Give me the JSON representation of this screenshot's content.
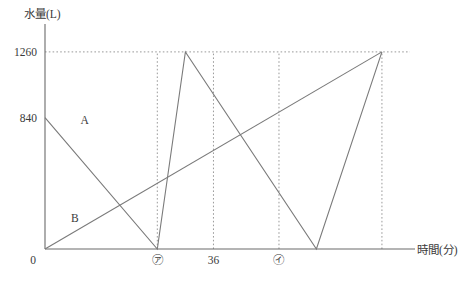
{
  "chart_data": {
    "type": "line",
    "title": "",
    "xlabel": "時間(分)",
    "ylabel": "水量(L)",
    "xlim": [
      0,
      78
    ],
    "ylim": [
      0,
      1400
    ],
    "grid": false,
    "legend_position": "inline",
    "y_ticks": [
      {
        "value": 1260,
        "label": "1260"
      },
      {
        "value": 840,
        "label": "840"
      },
      {
        "value": 0,
        "label": "0"
      }
    ],
    "x_ticks": [
      {
        "value": 0,
        "label": "0"
      },
      {
        "value": 24,
        "label": "㋐"
      },
      {
        "value": 36,
        "label": "36"
      },
      {
        "value": 50,
        "label": "㋑"
      }
    ],
    "guides": [
      {
        "kind": "horizontal",
        "value": 1260,
        "style": "dotted"
      },
      {
        "kind": "vertical",
        "value": 24,
        "style": "dotted"
      },
      {
        "kind": "vertical",
        "value": 36,
        "style": "dotted"
      },
      {
        "kind": "vertical",
        "value": 50,
        "style": "dotted"
      },
      {
        "kind": "vertical",
        "value": 72,
        "style": "dotted"
      }
    ],
    "series": [
      {
        "name": "A",
        "label": "A",
        "label_point": {
          "x": 5,
          "y": 840
        },
        "points": [
          {
            "x": 0,
            "y": 840
          },
          {
            "x": 24,
            "y": 0
          },
          {
            "x": 30,
            "y": 1260
          },
          {
            "x": 58,
            "y": 0
          },
          {
            "x": 72,
            "y": 1260
          }
        ]
      },
      {
        "name": "B",
        "label": "B",
        "label_point": {
          "x": 3,
          "y": 210
        },
        "points": [
          {
            "x": 0,
            "y": 0
          },
          {
            "x": 72,
            "y": 1260
          }
        ]
      }
    ],
    "annotations": []
  },
  "figure": {
    "y_axis_caption": "水量(L)",
    "x_axis_caption": "時間(分)"
  }
}
